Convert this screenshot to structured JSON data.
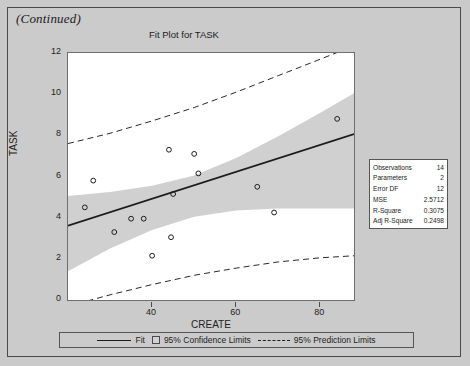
{
  "page": {
    "continued_label": "(Continued)",
    "background_color": "#cacaca"
  },
  "figure": {
    "title": "Fit Plot for TASK"
  },
  "stats_box": {
    "rows": [
      {
        "label": "Observations",
        "value": "14"
      },
      {
        "label": "Parameters",
        "value": "2"
      },
      {
        "label": "Error DF",
        "value": "12"
      },
      {
        "label": "MSE",
        "value": "2.5712"
      },
      {
        "label": "R-Square",
        "value": "0.3075"
      },
      {
        "label": "Adj R-Square",
        "value": "0.2498"
      }
    ]
  },
  "legend": {
    "fit_label": "Fit",
    "confidence_label": "95% Confidence Limits",
    "prediction_label": "95% Prediction Limits"
  },
  "chart_data": {
    "type": "scatter",
    "title": "Fit Plot for TASK",
    "xlabel": "CREATE",
    "ylabel": "TASK",
    "xlim": [
      20,
      88
    ],
    "ylim": [
      0,
      12
    ],
    "xticks": [
      40,
      60,
      80
    ],
    "yticks": [
      0,
      2,
      4,
      6,
      8,
      10,
      12
    ],
    "grid": false,
    "legend_position": "bottom",
    "marker": "open-circle",
    "points": [
      {
        "x": 24.0,
        "y": 4.5
      },
      {
        "x": 26.0,
        "y": 5.8
      },
      {
        "x": 31.0,
        "y": 3.3
      },
      {
        "x": 35.0,
        "y": 3.95
      },
      {
        "x": 38.0,
        "y": 3.95
      },
      {
        "x": 40.0,
        "y": 2.15
      },
      {
        "x": 44.0,
        "y": 7.3
      },
      {
        "x": 45.0,
        "y": 5.15
      },
      {
        "x": 44.5,
        "y": 3.05
      },
      {
        "x": 50.0,
        "y": 7.1
      },
      {
        "x": 51.0,
        "y": 6.15
      },
      {
        "x": 65.0,
        "y": 5.5
      },
      {
        "x": 69.0,
        "y": 4.25
      },
      {
        "x": 84.0,
        "y": 8.8
      }
    ],
    "fit_line": {
      "intercept": 2.3,
      "slope": 0.0655
    },
    "confidence_band": {
      "label": "95% Confidence Limits",
      "lower": [
        {
          "x": 20,
          "y": 1.4
        },
        {
          "x": 30,
          "y": 2.5
        },
        {
          "x": 40,
          "y": 3.4
        },
        {
          "x": 50,
          "y": 4.05
        },
        {
          "x": 60,
          "y": 4.35
        },
        {
          "x": 70,
          "y": 4.45
        },
        {
          "x": 80,
          "y": 4.45
        },
        {
          "x": 88,
          "y": 4.45
        }
      ],
      "upper": [
        {
          "x": 20,
          "y": 5.05
        },
        {
          "x": 30,
          "y": 5.25
        },
        {
          "x": 40,
          "y": 5.55
        },
        {
          "x": 50,
          "y": 6.05
        },
        {
          "x": 60,
          "y": 6.9
        },
        {
          "x": 70,
          "y": 7.95
        },
        {
          "x": 80,
          "y": 9.1
        },
        {
          "x": 88,
          "y": 10.05
        }
      ]
    },
    "prediction_band": {
      "label": "95% Prediction Limits",
      "lower": [
        {
          "x": 20,
          "y": -0.3
        },
        {
          "x": 30,
          "y": 0.25
        },
        {
          "x": 40,
          "y": 0.75
        },
        {
          "x": 50,
          "y": 1.2
        },
        {
          "x": 60,
          "y": 1.55
        },
        {
          "x": 70,
          "y": 1.85
        },
        {
          "x": 80,
          "y": 2.05
        },
        {
          "x": 88,
          "y": 2.15
        }
      ],
      "upper": [
        {
          "x": 20,
          "y": 7.6
        },
        {
          "x": 30,
          "y": 8.1
        },
        {
          "x": 40,
          "y": 8.7
        },
        {
          "x": 50,
          "y": 9.35
        },
        {
          "x": 60,
          "y": 10.1
        },
        {
          "x": 70,
          "y": 10.9
        },
        {
          "x": 80,
          "y": 11.7
        },
        {
          "x": 88,
          "y": 12.35
        }
      ]
    }
  }
}
